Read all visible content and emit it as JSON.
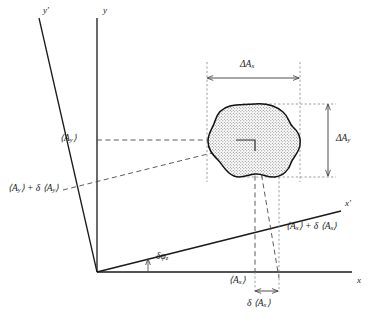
{
  "figure": {
    "width": 376,
    "height": 322,
    "background": "#ffffff",
    "line_color": "#1a1a1a",
    "fill_color": "#d8d8d8"
  },
  "axes": {
    "y_label": "y",
    "y_prime_label": "y′",
    "x_label": "x",
    "x_prime_label": "x′",
    "origin_label": ""
  },
  "labels": {
    "mean_ay": "⟨A",
    "mean_ay_sub": "y",
    "mean_ay_close": "⟩",
    "mean_ay_shift_pre": "⟨A",
    "mean_ay_shift_sub1": "y",
    "mean_ay_shift_mid": "⟩ + δ ⟨A",
    "mean_ay_shift_sub2": "y",
    "mean_ay_shift_close": "⟩",
    "mean_ax": "⟨A",
    "mean_ax_sub": "x",
    "mean_ax_close": "⟩",
    "mean_ax_shift_pre": "⟨A",
    "mean_ax_shift_sub1": "x",
    "mean_ax_shift_mid": "⟩ + δ ⟨A",
    "mean_ax_shift_sub2": "x",
    "mean_ax_shift_close": "⟩",
    "delta_ax_pre": "δ ⟨A",
    "delta_ax_sub": "x",
    "delta_ax_close": "⟩",
    "extent_ax_pre": "ΔA",
    "extent_ax_sub": "x",
    "extent_ay_pre": "ΔA",
    "extent_ay_sub": "y",
    "angle_pre": "δφ",
    "angle_sub": "z"
  },
  "geometry": {
    "origin": [
      97,
      272
    ],
    "y_axis_top": [
      97,
      18
    ],
    "y_prime_top": [
      39,
      18
    ],
    "x_axis_right": [
      352,
      272
    ],
    "x_prime_right": [
      341,
      211
    ],
    "blob_center": [
      255,
      140
    ],
    "bbox_left": 207,
    "bbox_right": 300,
    "bbox_top": 104,
    "bbox_bottom": 177,
    "dim_ax_y": 72,
    "dim_ay_x": 328,
    "mean_ax_tick": 255,
    "shift_ax_tick": 279,
    "delta_bar_y": 291
  }
}
